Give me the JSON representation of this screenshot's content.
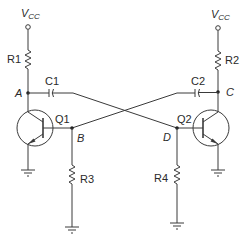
{
  "diagram": {
    "supply_left": {
      "main": "V",
      "sub": "CC"
    },
    "supply_right": {
      "main": "V",
      "sub": "CC"
    },
    "components": {
      "r1": "R1",
      "r2": "R2",
      "r3": "R3",
      "r4": "R4",
      "c1": "C1",
      "c2": "C2",
      "q1": "Q1",
      "q2": "Q2"
    },
    "nodes": {
      "a": "A",
      "b": "B",
      "c": "C",
      "d": "D"
    },
    "colors": {
      "line": "#3a3a3a",
      "text": "#2a2a2a",
      "background": "#ffffff"
    }
  }
}
